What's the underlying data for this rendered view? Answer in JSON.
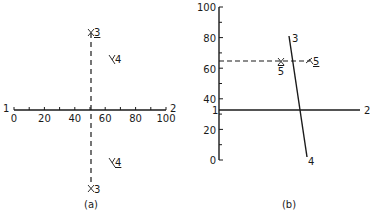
{
  "panel_a": {
    "caption": "(a)",
    "axis": {
      "start_label": "1",
      "end_label": "2",
      "ticks": [
        "0",
        "20",
        "40",
        "60",
        "80",
        "100"
      ],
      "range": [
        0,
        100
      ],
      "minor_tick_step": 10
    },
    "dashed_line": {
      "x_value": 50
    },
    "markers": [
      {
        "label": "3",
        "underlined": true,
        "position": "top"
      },
      {
        "label": "4",
        "underlined": false,
        "position": "upper-right"
      },
      {
        "label": "4",
        "underlined": true,
        "position": "lower-right"
      },
      {
        "label": "3",
        "underlined": false,
        "position": "bottom"
      }
    ]
  },
  "panel_b": {
    "caption": "(b)",
    "axis": {
      "ticks": [
        "0",
        "20",
        "40",
        "60",
        "80",
        "100"
      ],
      "range": [
        0,
        100
      ],
      "minor_tick_step": 10
    },
    "solid_line_12": {
      "y_value": 33,
      "start_label": "1",
      "end_label": "2"
    },
    "line_34": {
      "start_label": "3",
      "end_label": "4"
    },
    "dashed_line": {
      "y_value": 65
    },
    "markers": [
      {
        "label": "5",
        "underlined": false,
        "overlined": true,
        "position": "left-of-line-34"
      },
      {
        "label": "5",
        "underlined": true,
        "position": "right-of-line-34"
      }
    ]
  }
}
